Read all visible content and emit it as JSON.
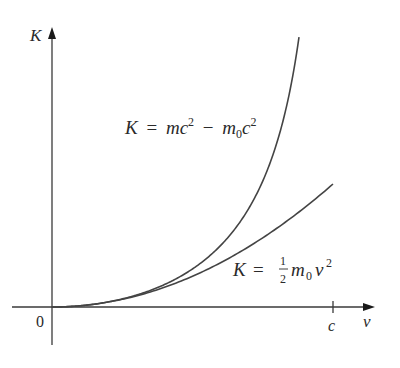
{
  "chart_data": {
    "type": "line",
    "title": "",
    "xlabel": "v",
    "ylabel": "K",
    "x_ticks": [
      {
        "value": 0,
        "label": "0"
      },
      {
        "value": 1,
        "label": "c"
      }
    ],
    "x_range": [
      0,
      1.15
    ],
    "y_range": [
      0,
      1.12
    ],
    "units": {
      "x": "fraction of c",
      "y": "m0 c^2"
    },
    "grid": false,
    "legend": null,
    "series": [
      {
        "name": "K = mc^2 - m0c^2",
        "kind": "relativistic",
        "x": [
          0,
          0.1,
          0.2,
          0.3,
          0.4,
          0.5,
          0.6,
          0.7,
          0.8,
          0.85,
          0.879
        ],
        "y": [
          0,
          0.005,
          0.021,
          0.048,
          0.091,
          0.155,
          0.25,
          0.4,
          0.667,
          0.898,
          1.1
        ]
      },
      {
        "name": "K = 1/2 m0 v^2",
        "kind": "classical",
        "x": [
          0,
          0.1,
          0.2,
          0.3,
          0.4,
          0.5,
          0.6,
          0.7,
          0.8,
          0.9,
          1.0
        ],
        "y": [
          0,
          0.005,
          0.02,
          0.045,
          0.08,
          0.125,
          0.18,
          0.245,
          0.32,
          0.405,
          0.5
        ]
      }
    ],
    "annotations": [
      {
        "text": "K = mc^2 - m0c^2",
        "target": "relativistic"
      },
      {
        "text": "K = 1/2 m0 v^2",
        "target": "classical"
      }
    ]
  },
  "labels": {
    "y_axis": "K",
    "x_axis": "v",
    "origin": "0",
    "c_tick": "c",
    "rel": {
      "K": "K",
      "eq": "=",
      "m": "m",
      "c1": "c",
      "sup1": "2",
      "minus": "−",
      "m0": "m",
      "sub0": "0",
      "c2": "c",
      "sup2": "2"
    },
    "cls": {
      "K": "K",
      "eq": "=",
      "num": "1",
      "den": "2",
      "m": "m",
      "sub0": "0",
      "v": "v",
      "sup": "2"
    }
  }
}
